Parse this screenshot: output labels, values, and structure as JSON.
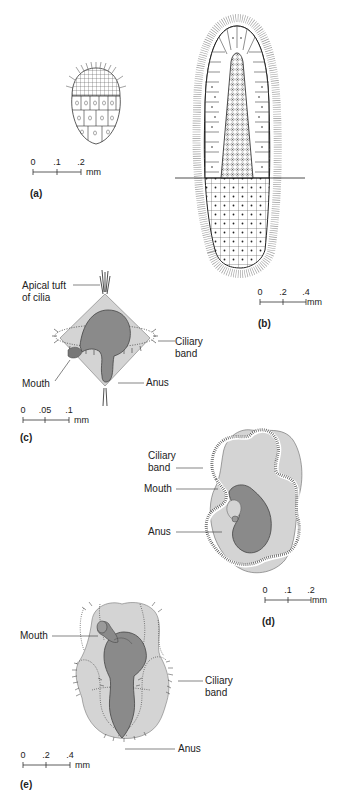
{
  "figure": {
    "panels": [
      {
        "id": "a",
        "letter": "(a)",
        "scale": {
          "ticks": [
            "0",
            ".1",
            ".2"
          ],
          "unit": "mm"
        }
      },
      {
        "id": "b",
        "letter": "(b)",
        "scale": {
          "ticks": [
            "0",
            ".2",
            ".4"
          ],
          "unit": "mm"
        }
      },
      {
        "id": "c",
        "letter": "(c)",
        "labels": {
          "apical_tuft": [
            "Apical tuft",
            "of cilia"
          ],
          "ciliary_band": [
            "Ciliary",
            "band"
          ],
          "mouth": "Mouth",
          "anus": "Anus"
        },
        "scale": {
          "ticks": [
            "0",
            ".05",
            ".1"
          ],
          "unit": "mm"
        }
      },
      {
        "id": "d",
        "letter": "(d)",
        "labels": {
          "ciliary_band": [
            "Ciliary",
            "band"
          ],
          "mouth": "Mouth",
          "anus": "Anus"
        },
        "scale": {
          "ticks": [
            "0",
            ".1",
            ".2"
          ],
          "unit": "mm"
        }
      },
      {
        "id": "e",
        "letter": "(e)",
        "labels": {
          "mouth": "Mouth",
          "ciliary_band": [
            "Ciliary",
            "band"
          ],
          "anus": "Anus"
        },
        "scale": {
          "ticks": [
            "0",
            ".2",
            ".4"
          ],
          "unit": "mm"
        }
      }
    ],
    "colors": {
      "body_light": "#d4d4d4",
      "gut_dark": "#8a8a8a",
      "outline": "#333333",
      "cell_fill": "#ffffff"
    }
  }
}
